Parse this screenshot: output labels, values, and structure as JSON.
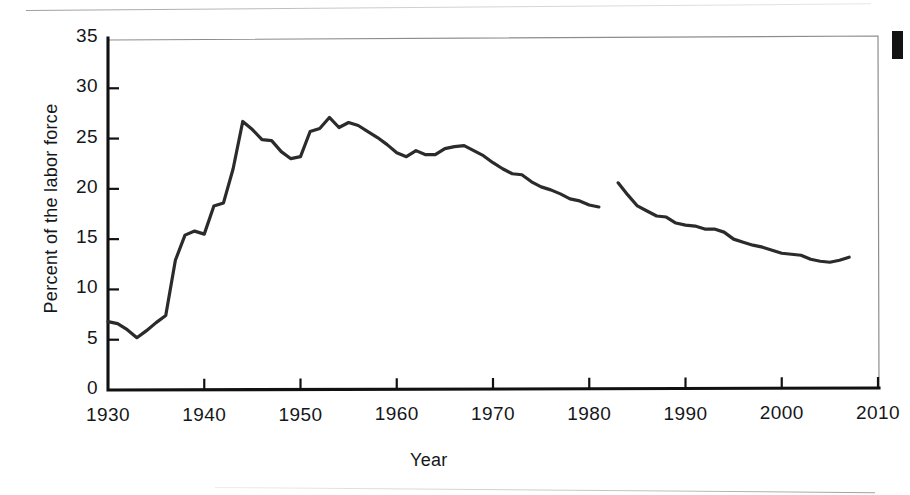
{
  "figure": {
    "corner_mark": "black-register-mark"
  },
  "chart_data": {
    "type": "line",
    "title": "",
    "xlabel": "Year",
    "ylabel": "Percent of the labor force",
    "xlim": [
      1930,
      2010
    ],
    "ylim": [
      0,
      35
    ],
    "x_ticks": [
      1930,
      1940,
      1950,
      1960,
      1970,
      1980,
      1990,
      2000,
      2010
    ],
    "x_tick_labels": [
      "1930",
      "1940",
      "1950",
      "1960",
      "1970",
      "1980",
      "1990",
      "2000",
      "2010"
    ],
    "y_ticks": [
      0,
      5,
      10,
      15,
      20,
      25,
      30,
      35
    ],
    "y_tick_labels": [
      "0",
      "5",
      "10",
      "15",
      "20",
      "25",
      "30",
      "35"
    ],
    "grid": false,
    "legend": false,
    "line_color": "#2b2b2b",
    "line_width": 3.2,
    "series": [
      {
        "name": "Union membership (series 1)",
        "x": [
          1930,
          1931,
          1932,
          1933,
          1934,
          1935,
          1936,
          1937,
          1938,
          1939,
          1940,
          1941,
          1942,
          1943,
          1944,
          1945,
          1946,
          1947,
          1948,
          1949,
          1950,
          1951,
          1952,
          1953,
          1954,
          1955,
          1956,
          1957,
          1958,
          1959,
          1960,
          1961,
          1962,
          1963,
          1964,
          1965,
          1966,
          1967,
          1968,
          1969,
          1970,
          1971,
          1972,
          1973,
          1974,
          1975,
          1976,
          1977,
          1978,
          1979,
          1980,
          1981
        ],
        "y": [
          6.8,
          6.6,
          6.0,
          5.2,
          5.9,
          6.7,
          7.4,
          12.9,
          15.4,
          15.8,
          15.5,
          18.3,
          18.6,
          22.0,
          26.7,
          25.9,
          24.9,
          24.8,
          23.7,
          23.0,
          23.2,
          25.7,
          26.0,
          27.1,
          26.1,
          26.6,
          26.3,
          25.7,
          25.1,
          24.4,
          23.6,
          23.2,
          23.8,
          23.4,
          23.4,
          24.0,
          24.2,
          24.3,
          23.8,
          23.3,
          22.6,
          22.0,
          21.5,
          21.4,
          20.7,
          20.2,
          19.9,
          19.5,
          19.0,
          18.8,
          18.4,
          18.2
        ]
      },
      {
        "name": "Union membership (series 2)",
        "x": [
          1983,
          1984,
          1985,
          1986,
          1987,
          1988,
          1989,
          1990,
          1991,
          1992,
          1993,
          1994,
          1995,
          1996,
          1997,
          1998,
          1999,
          2000,
          2001,
          2002,
          2003,
          2004,
          2005,
          2006,
          2007
        ],
        "y": [
          20.6,
          19.4,
          18.3,
          17.8,
          17.3,
          17.2,
          16.6,
          16.4,
          16.3,
          16.0,
          16.0,
          15.7,
          15.0,
          14.7,
          14.4,
          14.2,
          13.9,
          13.6,
          13.5,
          13.4,
          13.0,
          12.8,
          12.7,
          12.9,
          13.2
        ]
      }
    ]
  }
}
